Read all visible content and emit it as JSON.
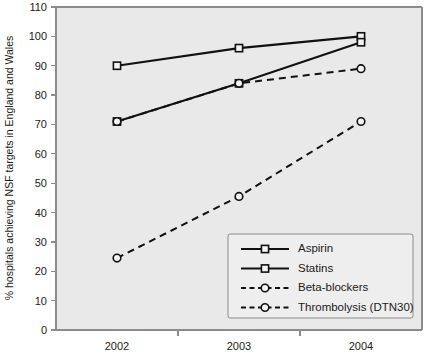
{
  "chart_data": {
    "type": "line",
    "title": "",
    "xlabel": "",
    "ylabel": "% hospitals achieving NSF targets in England and Wales",
    "categories": [
      "2002",
      "2003",
      "2004"
    ],
    "ylim": [
      0,
      110
    ],
    "yticks": [
      0,
      10,
      20,
      30,
      40,
      50,
      60,
      70,
      80,
      90,
      100,
      110
    ],
    "ytick_labels": [
      "0",
      "10",
      "20",
      "30",
      "40",
      "50",
      "60",
      "70",
      "80",
      "90",
      "100",
      "110"
    ],
    "grid": false,
    "legend_position": "lower right",
    "series": [
      {
        "name": "Aspirin",
        "values": [
          90,
          96,
          100
        ],
        "linestyle": "solid",
        "marker": "open-square",
        "color": "#111111"
      },
      {
        "name": "Statins",
        "values": [
          71,
          84,
          98
        ],
        "linestyle": "solid",
        "marker": "open-square",
        "color": "#111111"
      },
      {
        "name": "Beta-blockers",
        "values": [
          71,
          84,
          89
        ],
        "linestyle": "dashed",
        "marker": "open-circle",
        "color": "#111111"
      },
      {
        "name": "Thrombolysis (DTN30)",
        "values": [
          24.5,
          45.5,
          71
        ],
        "linestyle": "dashed",
        "marker": "open-circle",
        "color": "#111111"
      }
    ]
  },
  "legend": {
    "entries": [
      {
        "label": "Aspirin"
      },
      {
        "label": "Statins"
      },
      {
        "label": "Beta-blockers"
      },
      {
        "label": "Thrombolysis (DTN30)"
      }
    ]
  },
  "colors": {
    "plot_background": "#e9e9e9",
    "page_background": "#ffffff",
    "axis": "#8c8c8c",
    "ink": "#111111",
    "legend_background": "#eeeeee"
  }
}
